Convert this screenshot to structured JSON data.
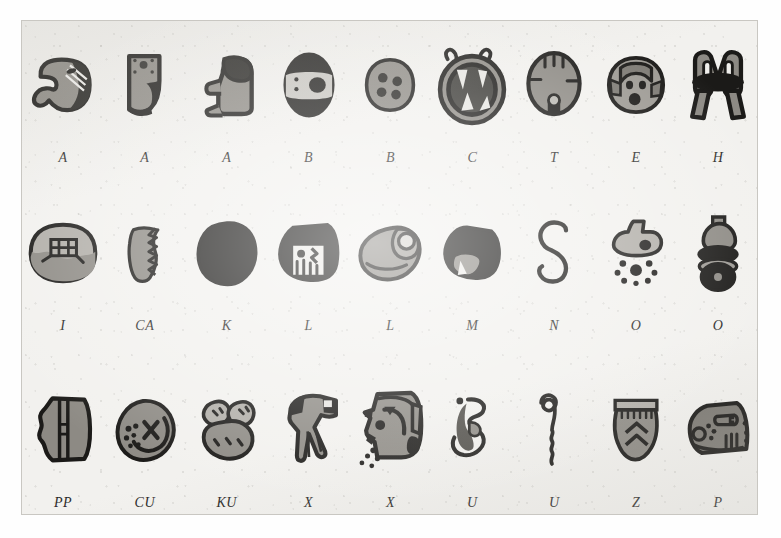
{
  "plate": {
    "title": "Glyph chart plate",
    "background_color": "#f2f1ee",
    "ink_color": "#1b1a18",
    "mid_tone_color": "#8d8a84",
    "light_tone_color": "#b6b3ad",
    "paper_border_color": "#c9c7c2",
    "rows": 3,
    "columns": 9
  },
  "rows": [
    {
      "index": 0,
      "cells": [
        {
          "label": "A",
          "icon": "glyph-hooked-head-icon",
          "tone": "mid"
        },
        {
          "label": "A",
          "icon": "glyph-boot-dotted-icon",
          "tone": "mid"
        },
        {
          "label": "A",
          "icon": "glyph-seated-figure-icon",
          "tone": "mid"
        },
        {
          "label": "B",
          "icon": "glyph-banded-oval-icon",
          "tone": "dark"
        },
        {
          "label": "B",
          "icon": "glyph-four-dot-oval-icon",
          "tone": "mid"
        },
        {
          "label": "C",
          "icon": "glyph-fanged-ring-icon",
          "tone": "dark"
        },
        {
          "label": "T",
          "icon": "glyph-striped-oval-icon",
          "tone": "mid"
        },
        {
          "label": "E",
          "icon": "glyph-three-dot-face-icon",
          "tone": "mid"
        },
        {
          "label": "H",
          "icon": "glyph-bound-bundle-icon",
          "tone": "mid"
        }
      ]
    },
    {
      "index": 1,
      "cells": [
        {
          "label": "I",
          "icon": "glyph-latticed-oval-icon",
          "tone": "mid"
        },
        {
          "label": "CA",
          "icon": "glyph-serrated-crescent-icon",
          "tone": "mid"
        },
        {
          "label": "K",
          "icon": "glyph-solid-blob-icon",
          "tone": "dark"
        },
        {
          "label": "L",
          "icon": "glyph-framed-panel-icon",
          "tone": "dark"
        },
        {
          "label": "L",
          "icon": "glyph-shell-spiral-icon",
          "tone": "mid"
        },
        {
          "label": "M",
          "icon": "glyph-clawed-wedge-icon",
          "tone": "dark"
        },
        {
          "label": "N",
          "icon": "glyph-s-curl-icon",
          "tone": "line"
        },
        {
          "label": "O",
          "icon": "glyph-dotted-burst-icon",
          "tone": "mid"
        },
        {
          "label": "O",
          "icon": "glyph-stacked-rings-icon",
          "tone": "dark"
        }
      ]
    },
    {
      "index": 2,
      "cells": [
        {
          "label": "PP",
          "icon": "glyph-split-shield-icon",
          "tone": "mid"
        },
        {
          "label": "CU",
          "icon": "glyph-crossed-disc-icon",
          "tone": "mid"
        },
        {
          "label": "KU",
          "icon": "glyph-three-lobes-icon",
          "tone": "mid"
        },
        {
          "label": "X",
          "icon": "glyph-open-hand-icon",
          "tone": "mid"
        },
        {
          "label": "X",
          "icon": "glyph-profile-head-icon",
          "tone": "mid"
        },
        {
          "label": "U",
          "icon": "glyph-hooked-loop-icon",
          "tone": "mid"
        },
        {
          "label": "U",
          "icon": "glyph-coiled-wave-icon",
          "tone": "line"
        },
        {
          "label": "Z",
          "icon": "glyph-chevron-vessel-icon",
          "tone": "mid"
        },
        {
          "label": "P",
          "icon": "glyph-reptile-head-icon",
          "tone": "mid"
        }
      ]
    }
  ]
}
